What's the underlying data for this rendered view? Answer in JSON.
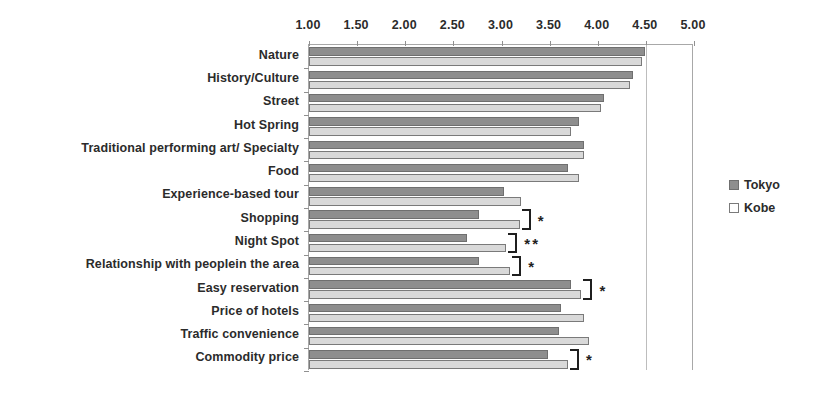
{
  "chart_data": {
    "type": "bar",
    "orientation": "horizontal",
    "title": "",
    "xlabel": "",
    "ylabel": "",
    "xlim": [
      1.0,
      5.0
    ],
    "xticks": [
      "1.00",
      "1.50",
      "2.00",
      "2.50",
      "3.00",
      "3.50",
      "4.00",
      "4.50",
      "5.00"
    ],
    "xtick_values": [
      1.0,
      1.5,
      2.0,
      2.5,
      3.0,
      3.5,
      4.0,
      4.5,
      5.0
    ],
    "grid": false,
    "gridlines_at": [
      4.5
    ],
    "legend_position": "right",
    "categories": [
      "Nature",
      "History/Culture",
      "Street",
      "Hot Spring",
      "Traditional   performing art/   Specialty",
      "Food",
      "Experience-based tour",
      "Shopping",
      "Night Spot",
      "Relationship with peoplein the area",
      "Easy reservation",
      "Price of hotels",
      "Traffic convenience",
      "Commodity price"
    ],
    "series": [
      {
        "name": "Tokyo",
        "color": "#8e8e8e",
        "values": [
          4.49,
          4.37,
          4.06,
          3.8,
          3.86,
          3.69,
          3.03,
          2.77,
          2.64,
          2.77,
          3.72,
          3.62,
          3.6,
          3.48
        ]
      },
      {
        "name": "Kobe",
        "color": "#d9d9d9",
        "values": [
          4.46,
          4.34,
          4.03,
          3.72,
          3.86,
          3.8,
          3.2,
          3.19,
          3.05,
          3.09,
          3.83,
          3.86,
          3.91,
          3.69
        ]
      }
    ],
    "annotations": [
      {
        "category": "Shopping",
        "mark": "*"
      },
      {
        "category": "Night Spot",
        "mark": "**"
      },
      {
        "category": "Relationship with peoplein the area",
        "mark": "*"
      },
      {
        "category": "Easy reservation",
        "mark": "*"
      },
      {
        "category": "Commodity price",
        "mark": "*"
      }
    ]
  },
  "legend": {
    "items": [
      {
        "label": "Tokyo",
        "swatch": "tokyo"
      },
      {
        "label": "Kobe",
        "swatch": "kobe"
      }
    ]
  }
}
